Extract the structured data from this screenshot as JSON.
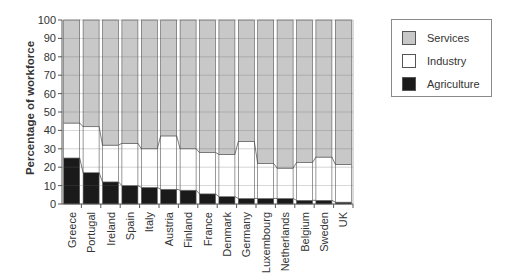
{
  "chart_data": {
    "type": "bar",
    "stacked": true,
    "title": "",
    "xlabel": "",
    "ylabel": "Percentage of workforce",
    "ylim": [
      0,
      100
    ],
    "yticks": [
      0,
      10,
      20,
      30,
      40,
      50,
      60,
      70,
      80,
      90,
      100
    ],
    "grid": "horizontal",
    "legend_position": "top-right",
    "categories": [
      "Greece",
      "Portugal",
      "Ireland",
      "Spain",
      "Italy",
      "Austria",
      "Finland",
      "France",
      "Denmark",
      "Germany",
      "Luxembourg",
      "Netherlands",
      "Belgium",
      "Sweden",
      "UK"
    ],
    "series": [
      {
        "name": "Agriculture",
        "color": "#1a1a1a",
        "values": [
          25,
          17,
          12,
          10,
          9,
          8,
          7.5,
          5.5,
          4,
          3,
          3,
          3,
          2,
          2,
          1
        ]
      },
      {
        "name": "Industry",
        "color": "#ffffff",
        "values": [
          19,
          25,
          20,
          23,
          21,
          29,
          22.5,
          22.5,
          23,
          31,
          19,
          16.5,
          20.5,
          23.5,
          20.5
        ]
      },
      {
        "name": "Services",
        "color": "#c8c8c8",
        "values": [
          56,
          58,
          68,
          67,
          70,
          63,
          70,
          72,
          73,
          66,
          78,
          80.5,
          77.5,
          74.5,
          78.5
        ]
      }
    ],
    "legend": [
      "Services",
      "Industry",
      "Agriculture"
    ]
  }
}
